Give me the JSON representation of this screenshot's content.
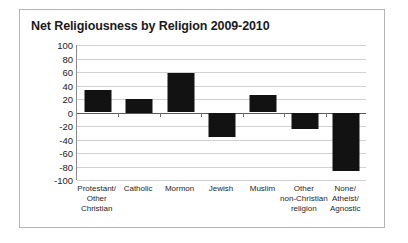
{
  "chart_data": {
    "type": "bar",
    "title": "Net Religiousness by Religion 2009-2010",
    "xlabel": "",
    "ylabel": "",
    "ylim": [
      -100,
      100
    ],
    "ytick_step": 20,
    "yticks": [
      100,
      80,
      60,
      40,
      20,
      0,
      -20,
      -40,
      -60,
      -80,
      -100
    ],
    "ytick_labels": [
      "100",
      "80",
      "60",
      "40",
      "20",
      "0",
      "-20",
      "-40",
      "-60",
      "-80",
      "-100"
    ],
    "grid": true,
    "legend": "none",
    "bar_color": "#121212",
    "categories": [
      "Protestant/ Other Christian",
      "Catholic",
      "Mormon",
      "Jewish",
      "Muslim",
      "Other non-Christian religion",
      "None/ Atheist/ Agnostic"
    ],
    "category_lines": [
      [
        "Protestant/",
        "Other",
        "Christian"
      ],
      [
        "Catholic"
      ],
      [
        "Mormon"
      ],
      [
        "Jewish"
      ],
      [
        "Muslim"
      ],
      [
        "Other",
        "non-Christian",
        "religion"
      ],
      [
        "None/",
        "Atheist/",
        "Agnostic"
      ]
    ],
    "values": [
      33,
      20,
      59,
      -37,
      26,
      -24,
      -87
    ],
    "series": [
      {
        "name": "Net Religiousness",
        "values": [
          33,
          20,
          59,
          -37,
          26,
          -24,
          -87
        ]
      }
    ]
  }
}
